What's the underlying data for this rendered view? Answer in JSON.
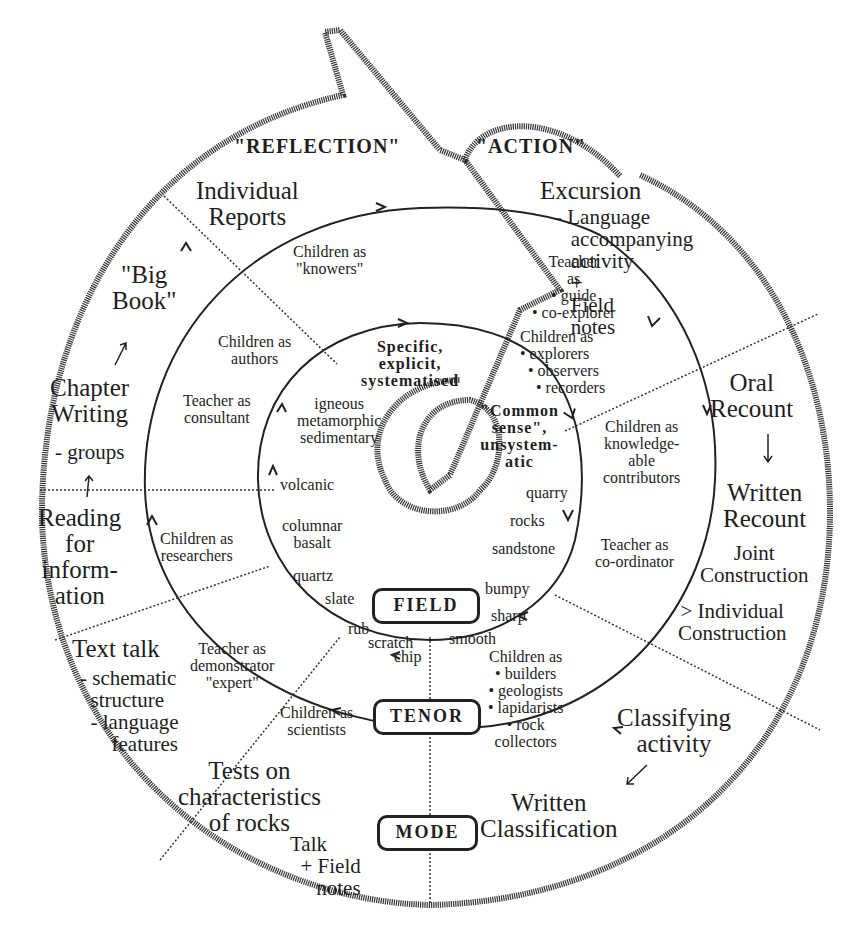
{
  "diagram": {
    "headers": {
      "reflection": "\"REFLECTION\"",
      "action": "\"ACTION\""
    },
    "outer_ring": {
      "individual_reports": "Individual\nReports",
      "big_book": "\"Big\nBook\"",
      "chapter_writing": "Chapter\nWriting",
      "chapter_writing_sub": "- groups",
      "reading_for_information": "Reading\nfor\ninform-\nation",
      "text_talk": "Text talk",
      "text_talk_sub": "- schematic\n  structure\n  - language\n      features",
      "tests_on_rocks": "Tests on\ncharacteristics\nof rocks",
      "talk_field_notes": "Talk\n  + Field\n     notes",
      "written_classification": "Written\nClassification",
      "classifying_activity": "Classifying\nactivity",
      "individual_construction": "> Individual\nConstruction",
      "joint_construction": "Joint\nConstruction",
      "written_recount": "Written\nRecount",
      "oral_recount": "Oral\nRecount",
      "excursion": "Excursion",
      "excursion_sub": "- Language\n   accompanying\n   activity\n   +\n   Field\n   notes"
    },
    "middle_ring": {
      "children_knowers": "Children as\n\"knowers\"",
      "children_authors": "Children as\nauthors",
      "teacher_consultant": "Teacher as\nconsultant",
      "children_researchers": "Children as\nresearchers",
      "teacher_demonstrator": "Teacher as\ndemonstrator\n\"expert\"",
      "children_scientists": "Children as\nscientists",
      "children_builders": "Children as\n• builders\n• geologists\n• lapidarists\n• rock\ncollectors",
      "teacher_coordinator": "Teacher as\nco-ordinator",
      "children_contributors": "Children as\nknowledge-\nable\ncontributors",
      "teacher_guide": "Teacher\nas\n• guide\n• co-explorer",
      "children_explorers": "Children as\n• explorers\n  • observers\n    • recorders"
    },
    "inner_ring": {
      "specific": "Specific,\nexplicit,\nsystematised",
      "common_sense": "\"Common\nsense\",\nunsystem-\natic",
      "igneous": "igneous\nmetamorphic\nsedimentary",
      "volcanic": "volcanic",
      "columnar_basalt": "columnar\nbasalt",
      "quartz": "quartz",
      "slate": "slate",
      "rub": "rub",
      "scratch": "scratch",
      "chip": "chip",
      "quarry": "quarry",
      "rocks": "rocks",
      "sandstone": "sandstone",
      "bumpy": "bumpy",
      "sharp": "sharp",
      "smooth": "smooth"
    },
    "boxes": {
      "field": "FIELD",
      "tenor": "TENOR",
      "mode": "MODE"
    },
    "colors": {
      "ink": "#1e1e1e",
      "background": "#ffffff"
    }
  }
}
